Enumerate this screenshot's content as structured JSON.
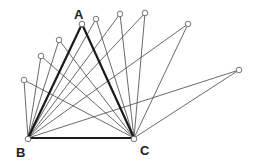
{
  "diagram": {
    "labels": {
      "A": "A",
      "B": "B",
      "C": "C"
    },
    "base": {
      "B": [
        28,
        138
      ],
      "C": [
        134,
        138
      ]
    },
    "highlighted_apex": "A",
    "apexes": [
      {
        "name": "A",
        "x": 82,
        "y": 24
      },
      {
        "name": "p1",
        "x": 24,
        "y": 80
      },
      {
        "name": "p2",
        "x": 41,
        "y": 56
      },
      {
        "name": "p3",
        "x": 59,
        "y": 40
      },
      {
        "name": "p4",
        "x": 96,
        "y": 19
      },
      {
        "name": "p5",
        "x": 120,
        "y": 14
      },
      {
        "name": "p6",
        "x": 145,
        "y": 13
      },
      {
        "name": "p7",
        "x": 188,
        "y": 24
      },
      {
        "name": "p8",
        "x": 239,
        "y": 70
      }
    ],
    "colors": {
      "line": "#444444",
      "bold_line": "#1a1a1a",
      "point_fill": "#ffffff",
      "point_stroke": "#666666"
    }
  }
}
